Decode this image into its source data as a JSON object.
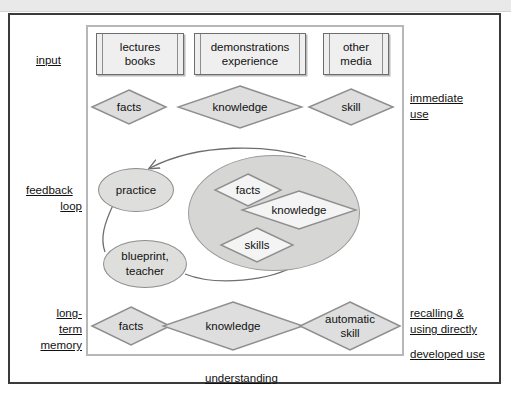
{
  "figure": {
    "caption": "understanding",
    "colors": {
      "outer_border": "#3a3a3a",
      "inner_panel_border": "#b7b7b7",
      "shape_fill_gray": "#dededd",
      "big_ellipse_fill": "#d6d6d5",
      "doc_fill": "#efefef",
      "diamond_fill": "#dedede",
      "inner_diamond_fill": "#f4f4f4",
      "shape_stroke": "#8e8e8e",
      "text": "#111111",
      "top_strip": "#e9e9e9"
    }
  },
  "left_labels": [
    {
      "id": "input",
      "lines": [
        "input"
      ]
    },
    {
      "id": "feedback-loop",
      "lines": [
        "feedback",
        "loop"
      ]
    },
    {
      "id": "long-term-memory",
      "lines": [
        "long-",
        "term",
        "memory"
      ]
    }
  ],
  "right_labels": [
    {
      "id": "immediate-use",
      "lines": [
        "immediate",
        "use"
      ]
    },
    {
      "id": "recalling-using-directly",
      "lines": [
        "recalling &",
        "using directly"
      ]
    },
    {
      "id": "developed-use",
      "lines": [
        "developed use"
      ]
    }
  ],
  "input_row": {
    "documents": [
      {
        "id": "lectures-books",
        "lines": [
          "lectures",
          "books"
        ]
      },
      {
        "id": "demonstrations-experience",
        "lines": [
          "demonstrations",
          "experience"
        ]
      },
      {
        "id": "other-media",
        "lines": [
          "other",
          "media"
        ]
      }
    ]
  },
  "immediate_row": {
    "diamonds": [
      {
        "id": "facts",
        "label": "facts"
      },
      {
        "id": "knowledge",
        "label": "knowledge"
      },
      {
        "id": "skill",
        "label": "skill"
      }
    ]
  },
  "feedback_row": {
    "ellipses": [
      {
        "id": "practice",
        "label": "practice"
      },
      {
        "id": "blueprint-teacher",
        "label": "blueprint,\nteacher"
      }
    ],
    "big_ellipse": {
      "id": "understanding-cluster",
      "diamonds": [
        {
          "id": "facts",
          "label": "facts"
        },
        {
          "id": "knowledge",
          "label": "knowledge"
        },
        {
          "id": "skills",
          "label": "skills"
        }
      ]
    }
  },
  "memory_row": {
    "diamonds": [
      {
        "id": "facts",
        "label": "facts"
      },
      {
        "id": "knowledge",
        "label": "knowledge"
      },
      {
        "id": "automatic-skill",
        "label": "automatic\nskill"
      }
    ]
  },
  "connectors": [
    {
      "id": "understanding-to-practice",
      "from": "understanding-cluster",
      "to": "practice",
      "arrow": true
    },
    {
      "id": "practice-to-blueprint",
      "from": "practice",
      "to": "blueprint-teacher",
      "arrow": false
    },
    {
      "id": "blueprint-to-understanding",
      "from": "blueprint-teacher",
      "to": "understanding-cluster",
      "arrow": false
    }
  ]
}
